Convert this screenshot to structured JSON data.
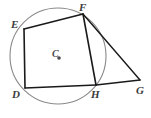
{
  "figure": {
    "background_color": "#ffffff",
    "stroke_color": "#1a1a1a",
    "circle_color": "#8a8a8a",
    "label_color": "#3b3b3b",
    "width": 151,
    "height": 118
  },
  "circle": {
    "name": "circle-c",
    "center_x": 58,
    "center_y": 56,
    "radius": 48,
    "stroke": "#8a8a8a",
    "stroke_width": 1.1,
    "center_dot_x": 59,
    "center_dot_y": 58,
    "center_dot_radius": 1.8
  },
  "points": {
    "E": {
      "label": "E",
      "x": 24,
      "y": 29,
      "label_x": 11,
      "label_y": 28
    },
    "F": {
      "label": "F",
      "x": 83,
      "y": 14,
      "label_x": 79,
      "label_y": 11
    },
    "D": {
      "label": "D",
      "x": 25,
      "y": 88,
      "label_x": 12,
      "label_y": 98
    },
    "H": {
      "label": "H",
      "x": 96,
      "y": 85,
      "label_x": 91,
      "label_y": 98
    },
    "G": {
      "label": "G",
      "x": 140,
      "y": 80,
      "label_x": 136,
      "label_y": 94
    },
    "C": {
      "label": "C",
      "x": 59,
      "y": 58,
      "label_x": 52,
      "label_y": 57
    }
  },
  "segments": [
    {
      "name": "segment-de",
      "from": "D",
      "to": "E"
    },
    {
      "name": "segment-ef",
      "from": "E",
      "to": "F"
    },
    {
      "name": "segment-fh",
      "from": "F",
      "to": "H"
    },
    {
      "name": "segment-hd",
      "from": "H",
      "to": "D"
    },
    {
      "name": "segment-fg",
      "from": "F",
      "to": "G"
    },
    {
      "name": "segment-hg",
      "from": "H",
      "to": "G"
    }
  ]
}
